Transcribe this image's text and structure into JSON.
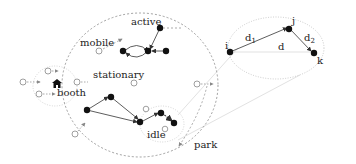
{
  "labels": {
    "active": "active",
    "mobile": "mobile",
    "stationary": "stationary",
    "booth": "booth",
    "idle": "idle",
    "park": "park"
  },
  "inset": {
    "nodes": {
      "i": "i",
      "j": "j",
      "k": "k"
    },
    "edges": {
      "d1": "d",
      "d1_sub": "1",
      "d2": "d",
      "d2_sub": "2",
      "d": "d"
    }
  },
  "colors": {
    "node_filled": "#111111",
    "node_open_stroke": "#777777",
    "dashed": "#888888",
    "edge": "#333333",
    "zoom_lines": "#dddddd"
  }
}
